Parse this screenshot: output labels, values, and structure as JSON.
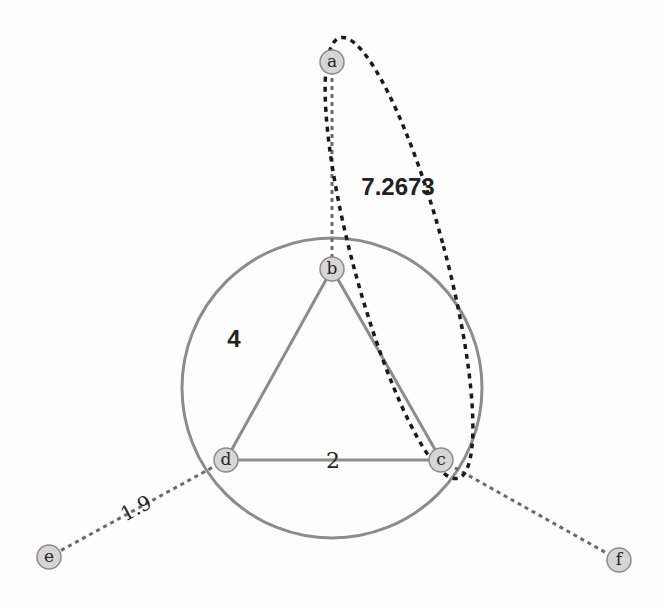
{
  "diagram": {
    "type": "weighted-graph",
    "nodes": [
      {
        "id": "a",
        "label": "a",
        "x": 332,
        "y": 62
      },
      {
        "id": "b",
        "label": "b",
        "x": 332,
        "y": 269
      },
      {
        "id": "c",
        "label": "c",
        "x": 441,
        "y": 460
      },
      {
        "id": "d",
        "label": "d",
        "x": 226,
        "y": 460
      },
      {
        "id": "e",
        "label": "e",
        "x": 49,
        "y": 557
      },
      {
        "id": "f",
        "label": "f",
        "x": 619,
        "y": 560
      }
    ],
    "edges": [
      {
        "from": "a",
        "to": "b",
        "style": "dashed"
      },
      {
        "from": "b",
        "to": "c",
        "style": "solid"
      },
      {
        "from": "b",
        "to": "d",
        "style": "solid"
      },
      {
        "from": "d",
        "to": "c",
        "style": "solid"
      },
      {
        "from": "d",
        "to": "e",
        "style": "dashed"
      },
      {
        "from": "c",
        "to": "f",
        "style": "dashed"
      }
    ],
    "circle": {
      "cx": 332,
      "cy": 388,
      "r": 150
    },
    "ellipse": {
      "cx": 399,
      "cy": 258,
      "rx": 46,
      "ry": 228,
      "rotate": -15
    },
    "labels": {
      "ellipse_weight": "7.2673",
      "circle_weight": "4",
      "edge_dc_weight": "2",
      "edge_de_weight": "1.9"
    },
    "colors": {
      "node_fill": "#d6d6d6",
      "node_stroke": "#8a8a8a",
      "solid_edge": "#8c8c8c",
      "dashed_edge": "#6a6a6a",
      "ellipse": "#1a1a1a",
      "background": "#fdfdfd"
    }
  }
}
